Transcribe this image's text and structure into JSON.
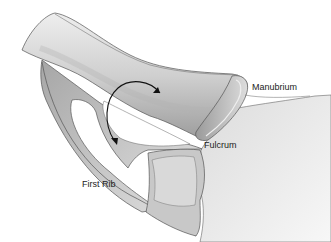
{
  "figure": {
    "labels": {
      "manubrium": "Manubrium",
      "fulcrum": "Fulcrum",
      "first_rib": "First Rib"
    },
    "arrows": {
      "description": "Curved double-headed arrow indicating rotation around the fulcrum"
    },
    "colors": {
      "bone_fill": "#d6d6d6",
      "bone_shadow": "#a8a8a8",
      "outline": "#555555",
      "background": "#ffffff",
      "sternum_fill": "#e6e6e6",
      "arrow": "#111111"
    }
  }
}
